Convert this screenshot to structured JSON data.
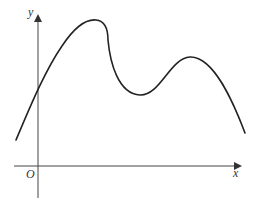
{
  "figure": {
    "axes": {
      "x_label": "x",
      "y_label": "y",
      "origin_label": "O"
    },
    "curve": {
      "description": "smooth curve with a maximum, a minimum, then another smaller maximum, descending at the right end",
      "color": "#222222"
    },
    "axis_color": "#444444"
  }
}
